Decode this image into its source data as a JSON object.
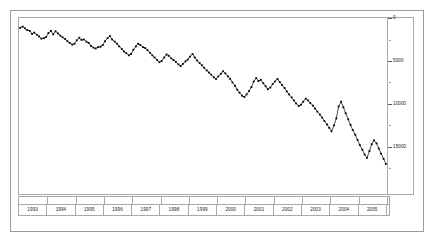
{
  "chart_data": {
    "type": "line",
    "title": "",
    "subtitle": "",
    "xlabel": "",
    "ylabel": "",
    "xlim": [
      1993.0,
      2006.0
    ],
    "ylim": [
      0,
      20500
    ],
    "y_axis_inverted": true,
    "y_axis_position": "right",
    "grid": false,
    "legend": null,
    "marker": "square",
    "line_color": "#000000",
    "marker_color": "#000000",
    "y_ticks": [
      0,
      5000,
      10000,
      15000
    ],
    "y_tick_labels": [
      "0",
      "5000",
      "10000",
      "15000"
    ],
    "y_minor_ticks": [
      2500,
      7500,
      12500,
      17500
    ],
    "x_tick_labels": [
      "1993",
      "1994",
      "1995",
      "1996",
      "1997",
      "1998",
      "1999",
      "2000",
      "2001",
      "2002",
      "2003",
      "2004",
      "2005"
    ],
    "x_frequency": "monthly",
    "series": [
      {
        "name": "series-1",
        "x": [
          1993.04,
          1993.13,
          1993.21,
          1993.29,
          1993.38,
          1993.46,
          1993.54,
          1993.63,
          1993.71,
          1993.79,
          1993.88,
          1993.96,
          1994.04,
          1994.13,
          1994.21,
          1994.29,
          1994.38,
          1994.46,
          1994.54,
          1994.63,
          1994.71,
          1994.79,
          1994.88,
          1994.96,
          1995.04,
          1995.13,
          1995.21,
          1995.29,
          1995.38,
          1995.46,
          1995.54,
          1995.63,
          1995.71,
          1995.79,
          1995.88,
          1995.96,
          1996.04,
          1996.13,
          1996.21,
          1996.29,
          1996.38,
          1996.46,
          1996.54,
          1996.63,
          1996.71,
          1996.79,
          1996.88,
          1996.96,
          1997.04,
          1997.13,
          1997.21,
          1997.29,
          1997.38,
          1997.46,
          1997.54,
          1997.63,
          1997.71,
          1997.79,
          1997.88,
          1997.96,
          1998.04,
          1998.13,
          1998.21,
          1998.29,
          1998.38,
          1998.46,
          1998.54,
          1998.63,
          1998.71,
          1998.79,
          1998.88,
          1998.96,
          1999.04,
          1999.13,
          1999.21,
          1999.29,
          1999.38,
          1999.46,
          1999.54,
          1999.63,
          1999.71,
          1999.79,
          1999.88,
          1999.96,
          2000.04,
          2000.13,
          2000.21,
          2000.29,
          2000.38,
          2000.46,
          2000.54,
          2000.63,
          2000.71,
          2000.79,
          2000.88,
          2000.96,
          2001.04,
          2001.13,
          2001.21,
          2001.29,
          2001.38,
          2001.46,
          2001.54,
          2001.63,
          2001.71,
          2001.79,
          2001.88,
          2001.96,
          2002.04,
          2002.13,
          2002.21,
          2002.29,
          2002.38,
          2002.46,
          2002.54,
          2002.63,
          2002.71,
          2002.79,
          2002.88,
          2002.96,
          2003.04,
          2003.13,
          2003.21,
          2003.29,
          2003.38,
          2003.46,
          2003.54,
          2003.63,
          2003.71,
          2003.79,
          2003.88,
          2003.96,
          2004.04,
          2004.13,
          2004.21,
          2004.29,
          2004.38,
          2004.46,
          2004.54,
          2004.63,
          2004.71,
          2004.79,
          2004.88,
          2004.96,
          2005.04,
          2005.13,
          2005.21,
          2005.29,
          2005.38,
          2005.46,
          2005.54,
          2005.63,
          2005.71,
          2005.79,
          2005.88,
          2005.96
        ],
        "values": [
          1150,
          1000,
          1200,
          1400,
          1500,
          1850,
          1700,
          1950,
          2150,
          2400,
          2350,
          2200,
          1750,
          1500,
          1900,
          1550,
          1800,
          2050,
          2250,
          2450,
          2700,
          2900,
          3100,
          3000,
          2600,
          2300,
          2550,
          2500,
          2750,
          2900,
          3250,
          3450,
          3550,
          3400,
          3350,
          3150,
          2700,
          2350,
          2100,
          2500,
          2750,
          3000,
          3300,
          3600,
          3900,
          4100,
          4350,
          4200,
          3700,
          3300,
          3000,
          3150,
          3400,
          3500,
          3750,
          4050,
          4350,
          4600,
          4900,
          5150,
          5000,
          4600,
          4250,
          4400,
          4700,
          4900,
          5100,
          5400,
          5600,
          5350,
          5050,
          4850,
          4500,
          4200,
          4600,
          4950,
          5250,
          5500,
          5800,
          6100,
          6350,
          6600,
          6900,
          7100,
          6800,
          6500,
          6200,
          6450,
          6800,
          7100,
          7500,
          7900,
          8350,
          8700,
          9050,
          9200,
          8900,
          8500,
          8050,
          7400,
          7000,
          7350,
          7200,
          7600,
          7950,
          8300,
          8100,
          7700,
          7400,
          7100,
          7450,
          7800,
          8150,
          8550,
          8900,
          9250,
          9600,
          9950,
          10250,
          10100,
          9750,
          9400,
          9600,
          9900,
          10200,
          10550,
          10900,
          11250,
          11600,
          12000,
          12400,
          12800,
          13200,
          12500,
          11700,
          10300,
          9750,
          10400,
          11100,
          11800,
          12450,
          13050,
          13600,
          14200,
          14800,
          15350,
          15900,
          16300,
          15500,
          14700,
          14250,
          14600,
          15200,
          15800,
          16400,
          17000
        ]
      }
    ]
  },
  "axis": {
    "y_labels": [
      "0",
      "5000",
      "10000",
      "15000"
    ],
    "x_labels": [
      "1993",
      "1994",
      "1995",
      "1996",
      "1997",
      "1998",
      "1999",
      "2000",
      "2001",
      "2002",
      "2003",
      "2004",
      "2005"
    ]
  }
}
